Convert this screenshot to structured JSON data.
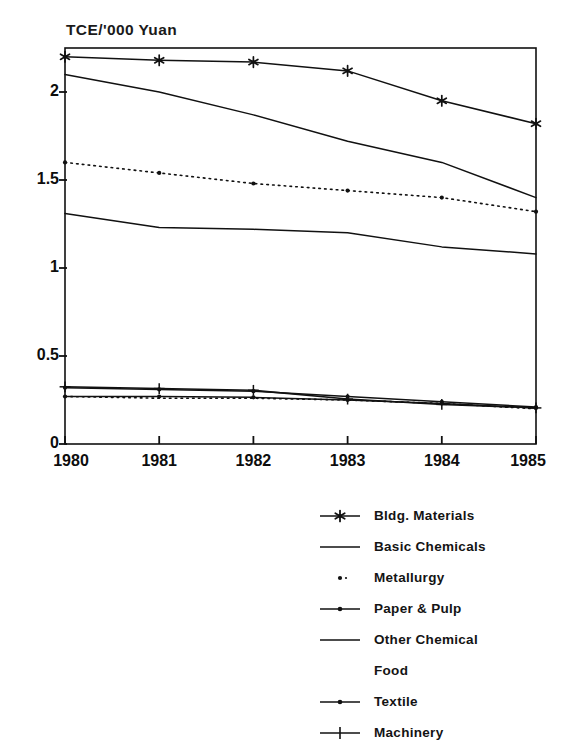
{
  "chart_data": {
    "type": "line",
    "title": "TCE/'000 Yuan",
    "xlabel": "",
    "ylabel": "TCE/'000 Yuan",
    "x": [
      "1980",
      "1981",
      "1982",
      "1983",
      "1984",
      "1985"
    ],
    "categories": [
      "1980",
      "1981",
      "1982",
      "1983",
      "1984",
      "1985"
    ],
    "xlim": [
      1980,
      1985
    ],
    "ylim": [
      0,
      2.25
    ],
    "yticks": [
      "0",
      "0.5",
      "1",
      "1.5",
      "2"
    ],
    "ytick_values": [
      0,
      0.5,
      1,
      1.5,
      2
    ],
    "grid": false,
    "legend_position": "bottom-right",
    "series": [
      {
        "name": "Bldg. Materials",
        "marker": "star",
        "style": "solid",
        "values": [
          2.2,
          2.18,
          2.17,
          2.12,
          1.95,
          1.82
        ]
      },
      {
        "name": "Basic Chemicals",
        "marker": "none",
        "style": "solid",
        "values": [
          2.1,
          2.0,
          1.87,
          1.72,
          1.6,
          1.4
        ]
      },
      {
        "name": "Metallurgy",
        "marker": "dot",
        "style": "dotted",
        "values": [
          1.6,
          1.54,
          1.48,
          1.44,
          1.4,
          1.32
        ]
      },
      {
        "name": "Paper & Pulp",
        "marker": "dot",
        "style": "solid",
        "values": [
          0.32,
          0.31,
          0.3,
          0.27,
          0.24,
          0.21
        ]
      },
      {
        "name": "Other Chemical",
        "marker": "none",
        "style": "solid",
        "values": [
          1.31,
          1.23,
          1.22,
          1.2,
          1.12,
          1.08
        ]
      },
      {
        "name": "Food",
        "marker": "none",
        "style": "dotted",
        "values": [
          0.27,
          0.26,
          0.26,
          0.25,
          0.23,
          0.2
        ]
      },
      {
        "name": "Textile",
        "marker": "dot",
        "style": "solid",
        "values": [
          0.27,
          0.27,
          0.265,
          0.25,
          0.23,
          0.205
        ]
      },
      {
        "name": "Machinery",
        "marker": "plus",
        "style": "solid",
        "values": [
          0.325,
          0.315,
          0.305,
          0.255,
          0.225,
          0.205
        ]
      }
    ]
  },
  "axis": {
    "title": "TCE/'000 Yuan",
    "y_tick_labels": [
      "2",
      "1.5",
      "1",
      "0.5",
      "0"
    ],
    "x_tick_labels": [
      "1980",
      "1981",
      "1982",
      "1983",
      "1984",
      "1985"
    ]
  },
  "legend": {
    "entries": [
      {
        "label": "Bldg. Materials",
        "key": "line-star-marker"
      },
      {
        "label": "Basic Chemicals",
        "key": "line-plain"
      },
      {
        "label": "Metallurgy",
        "key": "dot-marker"
      },
      {
        "label": "Paper & Pulp",
        "key": "line-dot-marker"
      },
      {
        "label": "Other Chemical",
        "key": "line-plain"
      },
      {
        "label": "Food",
        "key": "no-key"
      },
      {
        "label": "Textile",
        "key": "line-dot-marker"
      },
      {
        "label": "Machinery",
        "key": "line-plus-marker"
      }
    ]
  },
  "colors": {
    "ink": "#111111",
    "paper": "#ffffff"
  }
}
